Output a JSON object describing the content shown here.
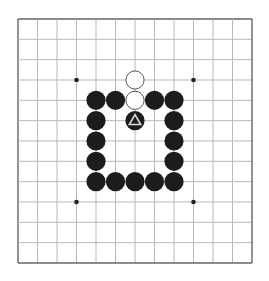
{
  "board": {
    "size": 13,
    "origin_x": 18,
    "origin_y": 19,
    "cell_w": 19.5,
    "cell_h": 20.33,
    "line_color": "#b8b8b8",
    "border_color": "#666666",
    "background": "#ffffff",
    "star_points": [
      [
        3,
        3
      ],
      [
        9,
        3
      ],
      [
        3,
        9
      ],
      [
        9,
        9
      ]
    ],
    "star_color": "#222222"
  },
  "stones": [
    {
      "color": "white",
      "col": 6,
      "row": 3
    },
    {
      "color": "white",
      "col": 6,
      "row": 4
    },
    {
      "color": "black",
      "col": 4,
      "row": 4
    },
    {
      "color": "black",
      "col": 5,
      "row": 4
    },
    {
      "color": "black",
      "col": 7,
      "row": 4
    },
    {
      "color": "black",
      "col": 8,
      "row": 4
    },
    {
      "color": "black",
      "col": 4,
      "row": 5
    },
    {
      "color": "black",
      "col": 6,
      "row": 5,
      "marker": "triangle"
    },
    {
      "color": "black",
      "col": 8,
      "row": 5
    },
    {
      "color": "black",
      "col": 4,
      "row": 6
    },
    {
      "color": "black",
      "col": 8,
      "row": 6
    },
    {
      "color": "black",
      "col": 4,
      "row": 7
    },
    {
      "color": "black",
      "col": 8,
      "row": 7
    },
    {
      "color": "black",
      "col": 4,
      "row": 8
    },
    {
      "color": "black",
      "col": 5,
      "row": 8
    },
    {
      "color": "black",
      "col": 6,
      "row": 8
    },
    {
      "color": "black",
      "col": 7,
      "row": 8
    },
    {
      "color": "black",
      "col": 8,
      "row": 8
    }
  ],
  "colors": {
    "black_stone": "#1c1c1c",
    "white_stone_fill": "#ffffff",
    "white_stone_stroke": "#555555",
    "marker": "#d8d8d8"
  }
}
